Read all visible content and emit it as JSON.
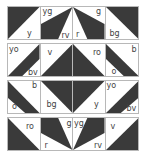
{
  "colors": {
    "dark": "#3a3a3a",
    "light": "#ffffff",
    "border": "#b8b8b8",
    "label": "#444444"
  },
  "rows": [
    {
      "tiles": [
        {
          "poly": "0,0 33,0 0,34",
          "labels": [
            {
              "text": "y",
              "x": 19,
              "y": 23
            }
          ]
        },
        {
          "poly": "33,0 0,18 0,34 18,34",
          "labels": [
            {
              "text": "yg",
              "x": 2,
              "y": 1
            },
            {
              "text": "rv",
              "x": 21,
              "y": 25
            }
          ]
        },
        {
          "poly": "0,0 33,18 33,34 15,34",
          "labels": [
            {
              "text": "g",
              "x": 23,
              "y": 1
            },
            {
              "text": "r",
              "x": 3,
              "y": 24
            }
          ]
        },
        {
          "poly": "0,0 33,0 33,34",
          "labels": [
            {
              "text": "bg",
              "x": 4,
              "y": 23
            }
          ]
        }
      ]
    },
    {
      "tiles": [
        {
          "poly": "0,34 33,0 33,16 15,34",
          "labels": [
            {
              "text": "yo",
              "x": 1,
              "y": 2
            },
            {
              "text": "bv",
              "x": 20,
              "y": 25
            }
          ]
        },
        {
          "poly": "33,0 33,34 0,34",
          "labels": [
            {
              "text": "v",
              "x": 7,
              "y": 5
            }
          ]
        },
        {
          "poly": "0,0 0,34 33,34",
          "labels": [
            {
              "text": "ro",
              "x": 20,
              "y": 5
            }
          ]
        },
        {
          "poly": "33,34 0,0 0,16 18,34",
          "labels": [
            {
              "text": "b",
              "x": 26,
              "y": 2
            },
            {
              "text": "o",
              "x": 6,
              "y": 24
            }
          ]
        }
      ]
    },
    {
      "tiles": [
        {
          "poly": "0,0 33,34 18,34 0,18",
          "labels": [
            {
              "text": "b",
              "x": 24,
              "y": 1
            },
            {
              "text": "o",
              "x": 4,
              "y": 22
            }
          ]
        },
        {
          "poly": "0,0 33,0 33,34",
          "labels": [
            {
              "text": "bg",
              "x": 6,
              "y": 20
            }
          ]
        },
        {
          "poly": "0,0 33,0 0,34",
          "labels": [
            {
              "text": "y",
              "x": 21,
              "y": 20
            }
          ]
        },
        {
          "poly": "33,0 0,34 15,34 33,18",
          "labels": [
            {
              "text": "yo",
              "x": 1,
              "y": 1
            },
            {
              "text": "bv",
              "x": 21,
              "y": 24
            }
          ]
        }
      ]
    },
    {
      "tiles": [
        {
          "poly": "0,0 0,34 33,34",
          "labels": [
            {
              "text": "ro",
              "x": 18,
              "y": 5
            }
          ]
        },
        {
          "poly": "0,0 18,0 33,34 0,16",
          "labels": [
            {
              "text": "g",
              "x": 26,
              "y": 2
            },
            {
              "text": "r",
              "x": 4,
              "y": 24
            }
          ]
        },
        {
          "poly": "33,0 15,0 0,34 33,16",
          "labels": [
            {
              "text": "yg",
              "x": 1,
              "y": 2
            },
            {
              "text": "rv",
              "x": 21,
              "y": 24
            }
          ]
        },
        {
          "poly": "33,0 33,34 0,34",
          "labels": [
            {
              "text": "v",
              "x": 5,
              "y": 5
            }
          ]
        }
      ]
    }
  ]
}
